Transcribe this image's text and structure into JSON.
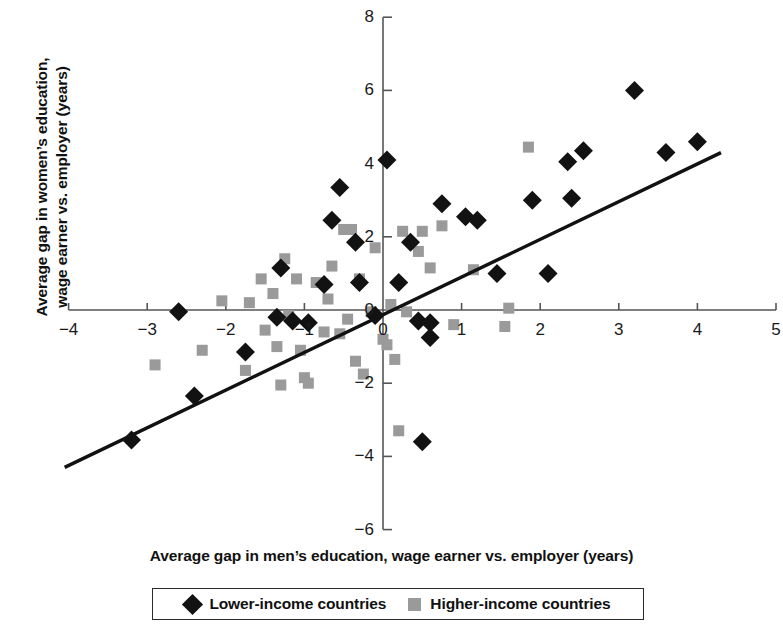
{
  "chart_data": {
    "type": "scatter",
    "title": "",
    "xlabel": "Average gap in men’s education, wage earner vs. employer (years)",
    "ylabel_line1": "Average gap in women’s education,",
    "ylabel_line2": "wage earner vs. employer (years)",
    "xlim": [
      -4.35,
      5.15
    ],
    "ylim": [
      -6.4,
      8.3
    ],
    "xticks": [
      -4,
      -3,
      -2,
      -1,
      0,
      1,
      2,
      3,
      4,
      5
    ],
    "xticklabels": [
      "−4",
      "−3",
      "−2",
      "−1",
      "0",
      "1",
      "2",
      "3",
      "4",
      "5"
    ],
    "yticks": [
      -6,
      -4,
      -2,
      0,
      2,
      4,
      6,
      8
    ],
    "yticklabels": [
      "−6",
      "−4",
      "−2",
      "0",
      "2",
      "4",
      "6",
      "8"
    ],
    "grid": false,
    "legend_position": "bottom",
    "axis_style": "zero-crossing-spines",
    "colors": {
      "lower_income": "#121212",
      "higher_income": "#9a9a9a",
      "trendline": "#111111",
      "axis": "#555555",
      "background": "#ffffff"
    },
    "series": [
      {
        "name": "Lower-income countries",
        "marker": "diamond",
        "color": "#121212",
        "points": [
          [
            -3.2,
            -3.55
          ],
          [
            -2.6,
            -0.05
          ],
          [
            -2.4,
            -2.35
          ],
          [
            -1.75,
            -1.15
          ],
          [
            -1.35,
            -0.2
          ],
          [
            -1.3,
            1.15
          ],
          [
            -1.15,
            -0.3
          ],
          [
            -0.95,
            -0.35
          ],
          [
            -0.75,
            0.7
          ],
          [
            -0.65,
            2.45
          ],
          [
            -0.55,
            3.35
          ],
          [
            -0.35,
            1.85
          ],
          [
            -0.3,
            0.75
          ],
          [
            -0.1,
            -0.15
          ],
          [
            0.05,
            4.1
          ],
          [
            0.2,
            0.75
          ],
          [
            0.35,
            1.85
          ],
          [
            0.45,
            -0.3
          ],
          [
            0.5,
            -3.6
          ],
          [
            0.6,
            -0.35
          ],
          [
            0.6,
            -0.75
          ],
          [
            0.75,
            2.9
          ],
          [
            1.05,
            2.55
          ],
          [
            1.2,
            2.45
          ],
          [
            1.45,
            1.0
          ],
          [
            1.9,
            3.0
          ],
          [
            2.1,
            1.0
          ],
          [
            2.35,
            4.05
          ],
          [
            2.4,
            3.05
          ],
          [
            2.55,
            4.35
          ],
          [
            3.2,
            6.0
          ],
          [
            3.6,
            4.3
          ],
          [
            4.0,
            4.6
          ]
        ]
      },
      {
        "name": "Higher-income countries",
        "marker": "square",
        "color": "#9a9a9a",
        "points": [
          [
            -2.9,
            -1.5
          ],
          [
            -2.3,
            -1.1
          ],
          [
            -2.05,
            0.25
          ],
          [
            -1.75,
            -1.65
          ],
          [
            -1.7,
            0.2
          ],
          [
            -1.55,
            0.85
          ],
          [
            -1.5,
            -0.55
          ],
          [
            -1.4,
            0.45
          ],
          [
            -1.35,
            -1.0
          ],
          [
            -1.3,
            -2.05
          ],
          [
            -1.25,
            1.4
          ],
          [
            -1.2,
            -0.15
          ],
          [
            -1.1,
            0.85
          ],
          [
            -1.05,
            -1.1
          ],
          [
            -1.0,
            -1.85
          ],
          [
            -0.95,
            -2.0
          ],
          [
            -0.85,
            0.75
          ],
          [
            -0.75,
            -0.6
          ],
          [
            -0.7,
            0.3
          ],
          [
            -0.65,
            1.2
          ],
          [
            -0.55,
            -0.65
          ],
          [
            -0.5,
            2.2
          ],
          [
            -0.45,
            -0.25
          ],
          [
            -0.4,
            2.2
          ],
          [
            -0.35,
            -1.4
          ],
          [
            -0.3,
            0.85
          ],
          [
            -0.25,
            -1.75
          ],
          [
            -0.15,
            -0.05
          ],
          [
            -0.1,
            1.7
          ],
          [
            0.0,
            -0.8
          ],
          [
            0.05,
            -0.95
          ],
          [
            0.1,
            0.15
          ],
          [
            0.15,
            -1.35
          ],
          [
            0.2,
            -3.3
          ],
          [
            0.25,
            2.15
          ],
          [
            0.3,
            -0.05
          ],
          [
            0.45,
            1.6
          ],
          [
            0.5,
            2.15
          ],
          [
            0.6,
            1.15
          ],
          [
            0.75,
            2.3
          ],
          [
            0.9,
            -0.4
          ],
          [
            1.15,
            1.1
          ],
          [
            1.55,
            -0.45
          ],
          [
            1.6,
            0.05
          ],
          [
            1.85,
            4.45
          ]
        ]
      }
    ],
    "trendline": {
      "type": "linear",
      "x_start": -4.05,
      "y_start": -4.3,
      "x_end": 4.3,
      "y_end": 4.3
    }
  },
  "legend": {
    "entries": [
      {
        "label": "Lower-income countries",
        "marker": "diamond-marker"
      },
      {
        "label": "Higher-income countries",
        "marker": "square-marker"
      }
    ]
  }
}
